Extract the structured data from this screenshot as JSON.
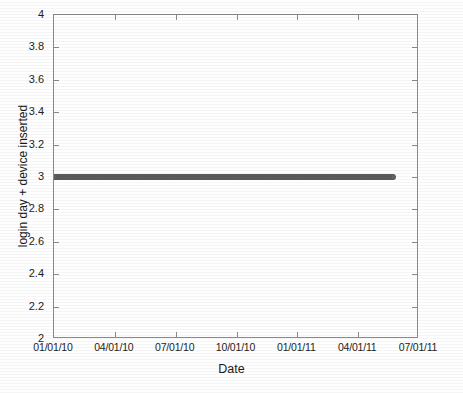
{
  "chart_data": {
    "type": "scatter",
    "title": "",
    "xlabel": "Date",
    "ylabel": "login day + device inserted",
    "xtick_labels": [
      "01/01/10",
      "04/01/10",
      "07/01/10",
      "10/01/10",
      "01/01/11",
      "04/01/11",
      "07/01/11"
    ],
    "ytick_labels": [
      "2",
      "2.2",
      "2.4",
      "2.6",
      "2.8",
      "3",
      "3.2",
      "3.4",
      "3.6",
      "3.8",
      "4"
    ],
    "ylim": [
      2,
      4
    ],
    "ytick_step": 0.2,
    "xlim": [
      "01/01/10",
      "07/01/11"
    ],
    "xtick_interval_months": 3,
    "grid": false,
    "legend": null,
    "marker": {
      "shape": "circle",
      "filled": false,
      "edge_color": "#5b5b5b",
      "size_px": 6
    },
    "series": [
      {
        "name": "login day + device inserted",
        "constant_y": 3,
        "x_start": "01/01/10",
        "x_end": "05/20/11",
        "x_coverage_fraction": 0.93,
        "point_count_approx": 505,
        "description": "Dense horizontal band of overlapping open-circle markers all at y = 3, spanning from 01/01/10 to approximately mid-May 2011."
      }
    ],
    "axes_style": {
      "box": true,
      "tick_direction": "in",
      "ticks_on_sides": [
        "left",
        "right",
        "top",
        "bottom"
      ],
      "axis_color": "#8a8a8a",
      "background": "#ffffff"
    }
  }
}
